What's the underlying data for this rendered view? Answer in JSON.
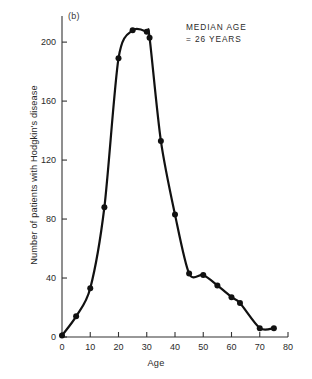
{
  "figure": {
    "panel_label": "(b)",
    "annotation_line1": "MEDIAN AGE",
    "annotation_line2": "= 26 YEARS",
    "line_color": "#111111",
    "marker_color": "#111111",
    "axis_color": "#333333",
    "background": "#ffffff"
  },
  "chart_data": {
    "type": "line",
    "title": "",
    "subtitle": "",
    "xlabel": "Age",
    "ylabel": "Number of patients with Hodgkin's disease",
    "xlim": [
      0,
      80
    ],
    "ylim": [
      0,
      215
    ],
    "grid": false,
    "legend": false,
    "legend_position": "none",
    "annotations": [
      {
        "text": "(b)",
        "position": "top-left"
      },
      {
        "text": "MEDIAN AGE = 26 YEARS",
        "position": "top-right"
      }
    ],
    "median_age": 26,
    "xticks": [
      0,
      10,
      20,
      30,
      40,
      50,
      60,
      70,
      80
    ],
    "xtick_labels": [
      "0",
      "10",
      "20",
      "30",
      "40",
      "50",
      "60",
      "70",
      "80"
    ],
    "yticks": [
      0,
      40,
      80,
      120,
      160,
      200
    ],
    "ytick_labels": [
      "0",
      "40",
      "80",
      "120",
      "160",
      "200"
    ],
    "x": [
      0,
      5,
      10,
      15,
      20,
      25,
      30,
      31,
      35,
      40,
      45,
      50,
      55,
      60,
      63,
      70,
      75
    ],
    "values": [
      1,
      14,
      33,
      88,
      189,
      208,
      207,
      203,
      133,
      83,
      43,
      42,
      35,
      27,
      23,
      6,
      6
    ],
    "series": [
      {
        "name": "Hodgkin's disease patients",
        "points": [
          {
            "x": 0,
            "y": 1
          },
          {
            "x": 5,
            "y": 14
          },
          {
            "x": 10,
            "y": 33
          },
          {
            "x": 15,
            "y": 88
          },
          {
            "x": 20,
            "y": 189
          },
          {
            "x": 25,
            "y": 208
          },
          {
            "x": 30,
            "y": 207
          },
          {
            "x": 31,
            "y": 203
          },
          {
            "x": 35,
            "y": 133
          },
          {
            "x": 40,
            "y": 83
          },
          {
            "x": 45,
            "y": 43
          },
          {
            "x": 50,
            "y": 42
          },
          {
            "x": 55,
            "y": 35
          },
          {
            "x": 60,
            "y": 27
          },
          {
            "x": 63,
            "y": 23
          },
          {
            "x": 70,
            "y": 6
          },
          {
            "x": 75,
            "y": 6
          }
        ]
      }
    ]
  }
}
